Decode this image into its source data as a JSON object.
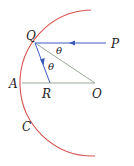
{
  "diagram": {
    "type": "concave-mirror-ray-diagram",
    "labels": {
      "Q": "Q",
      "P": "P",
      "theta1": "θ",
      "theta2": "θ",
      "A": "A",
      "R": "R",
      "O": "O",
      "C": "C"
    },
    "colors": {
      "mirror": "#d9534f",
      "ray": "#3b5bbf",
      "construction": "#9aaa95",
      "text": "#222222"
    },
    "points": {
      "Q": [
        35,
        43
      ],
      "P_end": [
        106,
        43
      ],
      "O": [
        95,
        83
      ],
      "A": [
        22,
        83
      ],
      "R": [
        50,
        83
      ]
    }
  }
}
